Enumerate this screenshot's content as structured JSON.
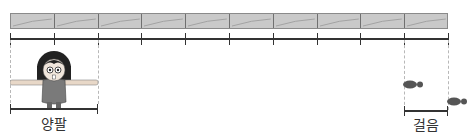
{
  "diagram": {
    "type": "measurement-illustration",
    "bar": {
      "segments": 10,
      "color": "#c9c9c9",
      "border": "#707070"
    },
    "ruler": {
      "ticks": 11
    },
    "labels": {
      "arm_span": "양팔",
      "step": "걸음"
    },
    "figures": {
      "person": "girl-with-arms-outstretched",
      "footprints": 2
    }
  }
}
